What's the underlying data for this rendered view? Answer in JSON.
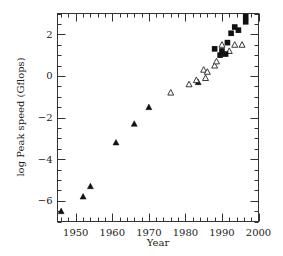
{
  "chart_data": {
    "type": "scatter",
    "title": "",
    "xlabel": "Year",
    "ylabel": "log Peak speed (Gflops)",
    "xlim": [
      1945,
      2000
    ],
    "ylim": [
      -7,
      3
    ],
    "x_ticks": [
      1950,
      1960,
      1970,
      1980,
      1990,
      2000
    ],
    "y_ticks": [
      -6,
      -4,
      -2,
      0,
      2
    ],
    "x_tick_labels": [
      "1950",
      "1960",
      "1970",
      "1980",
      "1990",
      "2000"
    ],
    "y_tick_labels": [
      "−6",
      "−4",
      "−2",
      "0",
      "2"
    ],
    "grid": false,
    "legend": null,
    "series": [
      {
        "name": "filled triangles",
        "marker": "filled-triangle",
        "points": [
          {
            "x": 1946,
            "y": -6.5
          },
          {
            "x": 1952,
            "y": -5.8
          },
          {
            "x": 1954,
            "y": -5.3
          },
          {
            "x": 1961,
            "y": -3.2
          },
          {
            "x": 1966,
            "y": -2.3
          },
          {
            "x": 1970,
            "y": -1.5
          },
          {
            "x": 1983.5,
            "y": -0.3
          }
        ]
      },
      {
        "name": "open triangles",
        "marker": "open-triangle",
        "points": [
          {
            "x": 1976,
            "y": -0.8
          },
          {
            "x": 1981,
            "y": -0.4
          },
          {
            "x": 1983,
            "y": -0.2
          },
          {
            "x": 1985,
            "y": 0.3
          },
          {
            "x": 1986,
            "y": 0.2
          },
          {
            "x": 1985.5,
            "y": -0.1
          },
          {
            "x": 1988,
            "y": 0.5
          },
          {
            "x": 1988.5,
            "y": 0.7
          },
          {
            "x": 1990,
            "y": 1.5
          },
          {
            "x": 1992,
            "y": 1.2
          },
          {
            "x": 1993.5,
            "y": 1.5
          },
          {
            "x": 1995.5,
            "y": 1.5
          }
        ]
      },
      {
        "name": "filled squares",
        "marker": "filled-square",
        "points": [
          {
            "x": 1988,
            "y": 1.3
          },
          {
            "x": 1989.5,
            "y": 1.0
          },
          {
            "x": 1990,
            "y": 1.2
          },
          {
            "x": 1991,
            "y": 1.05
          },
          {
            "x": 1991.5,
            "y": 1.6
          },
          {
            "x": 1992.5,
            "y": 2.05
          },
          {
            "x": 1993.5,
            "y": 2.35
          },
          {
            "x": 1994.5,
            "y": 2.2
          },
          {
            "x": 1996.5,
            "y": 2.6
          },
          {
            "x": 1996.5,
            "y": 2.85
          }
        ]
      }
    ]
  }
}
